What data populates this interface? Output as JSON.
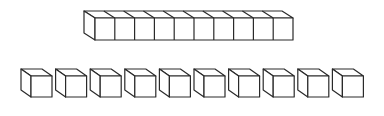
{
  "diagram": {
    "colors": {
      "stroke": "#2a2a2a",
      "fill": "#ffffff",
      "background": "#ffffff"
    },
    "rod": {
      "label": "ten-rod",
      "unit_count": 10,
      "front_x": 95,
      "front_y": 18,
      "unit_width": 19.8,
      "height": 22,
      "depth_dx": -11,
      "depth_dy": -7
    },
    "unit_cubes": {
      "label": "unit cubes",
      "count": 10,
      "first_front_x": 31,
      "front_y": 76,
      "size": 21,
      "spacing": 34.6,
      "depth_dx": -10,
      "depth_dy": -7
    }
  }
}
